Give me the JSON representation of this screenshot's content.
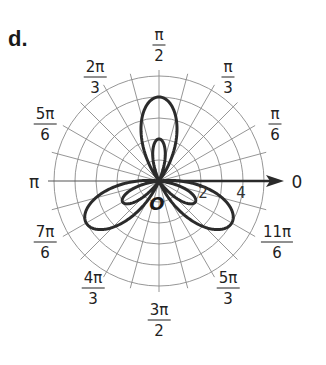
{
  "part_label": "d.",
  "origin_label": "O",
  "chart_data": {
    "type": "polar-line",
    "title": "d.",
    "equation_inferred": "r = 1 - 3 sin(3θ)",
    "series": [
      {
        "name": "polar curve",
        "r_max": 4,
        "inner_loop_r_max": 2,
        "big_lobe_directions": [
          "π/2",
          "7π/6",
          "11π/6"
        ],
        "small_loop_directions": [
          "π/2",
          "7π/6",
          "11π/6"
        ]
      }
    ],
    "radial_grid": [
      1,
      2,
      3,
      4,
      5
    ],
    "radial_tick_labels": [
      {
        "value": 2,
        "text": "2"
      },
      {
        "value": 4,
        "text": "4"
      }
    ],
    "angular_grid_step_deg": 15,
    "angle_labels": [
      {
        "deg": 0,
        "num": "0",
        "den": ""
      },
      {
        "deg": 30,
        "num": "π",
        "den": "6"
      },
      {
        "deg": 60,
        "num": "π",
        "den": "3"
      },
      {
        "deg": 90,
        "num": "π",
        "den": "2"
      },
      {
        "deg": 120,
        "num": "2π",
        "den": "3"
      },
      {
        "deg": 150,
        "num": "5π",
        "den": "6"
      },
      {
        "deg": 180,
        "num": "π",
        "den": ""
      },
      {
        "deg": 210,
        "num": "7π",
        "den": "6"
      },
      {
        "deg": 240,
        "num": "4π",
        "den": "3"
      },
      {
        "deg": 270,
        "num": "3π",
        "den": "2"
      },
      {
        "deg": 300,
        "num": "5π",
        "den": "3"
      },
      {
        "deg": 330,
        "num": "11π",
        "den": "6"
      }
    ],
    "polar_axis_arrow": true,
    "grid": true
  }
}
